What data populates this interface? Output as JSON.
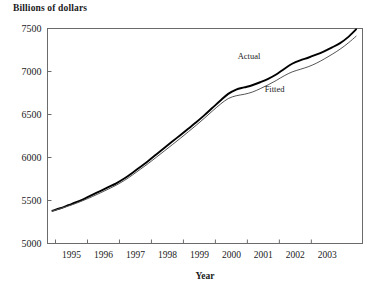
{
  "figure": {
    "top_label": "Billions of dollars"
  },
  "chart_data": {
    "type": "line",
    "title": "",
    "top_axis_label": "Billions of dollars",
    "xlabel": "Year",
    "ylabel": "",
    "xlim": [
      1994.75,
      2004.6
    ],
    "ylim": [
      5000,
      7500
    ],
    "ytick_labels": [
      "5000",
      "5500",
      "6000",
      "6500",
      "7000",
      "7500"
    ],
    "yticks": [
      5000,
      5500,
      6000,
      6500,
      7000,
      7500
    ],
    "xtick_labels": [
      "1995",
      "1996",
      "1997",
      "1998",
      "1999",
      "2000",
      "2001",
      "2002",
      "2003"
    ],
    "xticks": [
      1995,
      1996,
      1997,
      1998,
      1999,
      2000,
      2001,
      2002,
      2003
    ],
    "grid": false,
    "legend_position": "inline-annotation",
    "annotations": [
      {
        "text": "Actual",
        "x": 2001.05,
        "y": 7145
      },
      {
        "text": "Fitted",
        "x": 2001.85,
        "y": 6760
      }
    ],
    "series": [
      {
        "name": "Actual",
        "line_width": 1.9,
        "color": "#000000",
        "x": [
          1994.9,
          1995.15,
          1995.4,
          1995.65,
          1995.9,
          1996.15,
          1996.4,
          1996.65,
          1996.9,
          1997.15,
          1997.4,
          1997.65,
          1997.9,
          1998.15,
          1998.4,
          1998.65,
          1998.9,
          1999.15,
          1999.4,
          1999.65,
          1999.9,
          2000.15,
          2000.4,
          2000.65,
          2000.9,
          2001.15,
          2001.4,
          2001.65,
          2001.9,
          2002.15,
          2002.4,
          2002.65,
          2002.9,
          2003.15,
          2003.4,
          2003.65,
          2003.9,
          2004.15,
          2004.4
        ],
        "y": [
          5380,
          5410,
          5445,
          5480,
          5520,
          5565,
          5610,
          5655,
          5700,
          5755,
          5820,
          5890,
          5960,
          6035,
          6110,
          6185,
          6260,
          6335,
          6410,
          6490,
          6575,
          6660,
          6740,
          6790,
          6815,
          6840,
          6875,
          6915,
          6965,
          7030,
          7090,
          7130,
          7160,
          7195,
          7235,
          7280,
          7330,
          7400,
          7490
        ]
      },
      {
        "name": "Fitted",
        "line_width": 1.0,
        "color": "#555555",
        "x": [
          1994.9,
          1995.15,
          1995.4,
          1995.65,
          1995.9,
          1996.15,
          1996.4,
          1996.65,
          1996.9,
          1997.15,
          1997.4,
          1997.65,
          1997.9,
          1998.15,
          1998.4,
          1998.65,
          1998.9,
          1999.15,
          1999.4,
          1999.65,
          1999.9,
          2000.15,
          2000.4,
          2000.65,
          2000.9,
          2001.15,
          2001.4,
          2001.65,
          2001.9,
          2002.15,
          2002.4,
          2002.65,
          2002.9,
          2003.15,
          2003.4,
          2003.65,
          2003.9,
          2004.15,
          2004.4
        ],
        "y": [
          5378,
          5405,
          5435,
          5468,
          5505,
          5545,
          5588,
          5632,
          5678,
          5732,
          5795,
          5862,
          5930,
          6002,
          6075,
          6148,
          6222,
          6298,
          6375,
          6455,
          6538,
          6618,
          6685,
          6718,
          6735,
          6760,
          6800,
          6845,
          6895,
          6950,
          6995,
          7025,
          7055,
          7095,
          7145,
          7200,
          7260,
          7330,
          7410
        ]
      }
    ]
  }
}
